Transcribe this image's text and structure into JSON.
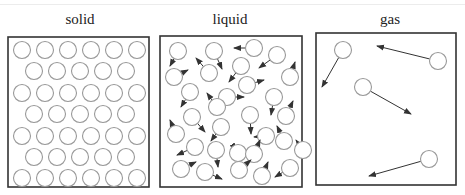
{
  "colors": {
    "box_stroke": "#333333",
    "particle_stroke": "#999999",
    "arrow_stroke": "#333333",
    "label_color": "#222222"
  },
  "panels": [
    {
      "id": "solid",
      "label": "solid",
      "label_x": 80,
      "box": {
        "x": 8,
        "y": 37,
        "w": 141,
        "h": 150
      }
    },
    {
      "id": "liquid",
      "label": "liquid",
      "label_x": 230,
      "box": {
        "x": 160,
        "y": 36,
        "w": 142,
        "h": 151
      }
    },
    {
      "id": "gas",
      "label": "gas",
      "label_x": 390,
      "box": {
        "x": 316,
        "y": 33,
        "w": 140,
        "h": 152
      }
    }
  ],
  "particle_radius": 8.5,
  "solid": {
    "rows": [
      {
        "y": 50,
        "xs": [
          22,
          45,
          68,
          91,
          114,
          137
        ]
      },
      {
        "y": 71,
        "xs": [
          34,
          57,
          80,
          103,
          126
        ]
      },
      {
        "y": 93,
        "xs": [
          22,
          45,
          68,
          91,
          114,
          137
        ]
      },
      {
        "y": 114,
        "xs": [
          34,
          57,
          80,
          103,
          126
        ]
      },
      {
        "y": 136,
        "xs": [
          22,
          45,
          68,
          91,
          114,
          137
        ]
      },
      {
        "y": 157,
        "xs": [
          34,
          57,
          80,
          103,
          126
        ]
      },
      {
        "y": 178,
        "xs": [
          22,
          45,
          68,
          91,
          114,
          137
        ]
      }
    ]
  },
  "liquid": {
    "particles": [
      {
        "x": 178,
        "y": 51,
        "ax": 170,
        "ay": 66
      },
      {
        "x": 214,
        "y": 51,
        "ax": 222,
        "ay": 69
      },
      {
        "x": 254,
        "y": 48,
        "ax": 234,
        "ay": 48
      },
      {
        "x": 277,
        "y": 55,
        "ax": 259,
        "ay": 68
      },
      {
        "x": 174,
        "y": 77,
        "ax": 188,
        "ay": 70
      },
      {
        "x": 209,
        "y": 73,
        "ax": 196,
        "ay": 58
      },
      {
        "x": 241,
        "y": 66,
        "ax": 229,
        "ay": 82
      },
      {
        "x": 290,
        "y": 77,
        "ax": 295,
        "ay": 62
      },
      {
        "x": 190,
        "y": 92,
        "ax": 181,
        "ay": 107
      },
      {
        "x": 247,
        "y": 85,
        "ax": 264,
        "ay": 80
      },
      {
        "x": 227,
        "y": 97,
        "ax": 244,
        "ay": 97
      },
      {
        "x": 274,
        "y": 97,
        "ax": 271,
        "ay": 115
      },
      {
        "x": 217,
        "y": 107,
        "ax": 207,
        "ay": 93
      },
      {
        "x": 192,
        "y": 117,
        "ax": 205,
        "ay": 132
      },
      {
        "x": 250,
        "y": 115,
        "ax": 251,
        "ay": 134
      },
      {
        "x": 286,
        "y": 116,
        "ax": 293,
        "ay": 101
      },
      {
        "x": 176,
        "y": 134,
        "ax": 170,
        "ay": 120
      },
      {
        "x": 221,
        "y": 127,
        "ax": 211,
        "ay": 141
      },
      {
        "x": 266,
        "y": 136,
        "ax": 254,
        "ay": 137
      },
      {
        "x": 284,
        "y": 141,
        "ax": 277,
        "ay": 126
      },
      {
        "x": 195,
        "y": 147,
        "ax": 177,
        "ay": 155
      },
      {
        "x": 216,
        "y": 150,
        "ax": 218,
        "ay": 167
      },
      {
        "x": 238,
        "y": 153,
        "ax": 236,
        "ay": 150
      },
      {
        "x": 254,
        "y": 154,
        "ax": 260,
        "ay": 140
      },
      {
        "x": 181,
        "y": 169,
        "ax": 196,
        "ay": 162
      },
      {
        "x": 205,
        "y": 172,
        "ax": 222,
        "ay": 179
      },
      {
        "x": 239,
        "y": 170,
        "ax": 251,
        "ay": 160
      },
      {
        "x": 262,
        "y": 176,
        "ax": 268,
        "ay": 162
      },
      {
        "x": 290,
        "y": 168,
        "ax": 275,
        "ay": 177
      },
      {
        "x": 303,
        "y": 150,
        "ax": 296,
        "ay": 140
      }
    ]
  },
  "gas": {
    "particles": [
      {
        "x": 343,
        "y": 50,
        "ax": 322,
        "ay": 87
      },
      {
        "x": 438,
        "y": 61,
        "ax": 377,
        "ay": 46
      },
      {
        "x": 363,
        "y": 87,
        "ax": 411,
        "ay": 114
      },
      {
        "x": 429,
        "y": 159,
        "ax": 369,
        "ay": 176
      }
    ]
  }
}
